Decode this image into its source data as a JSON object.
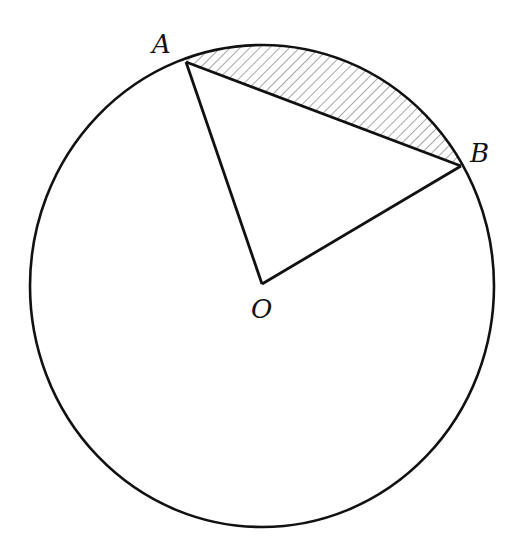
{
  "diagram": {
    "circle": {
      "cx": 262,
      "cy": 286,
      "rx": 232,
      "ry": 241
    },
    "points": {
      "A": {
        "label": "A",
        "x": 186,
        "y": 62
      },
      "B": {
        "label": "B",
        "x": 461,
        "y": 166
      },
      "O": {
        "label": "O",
        "x": 262,
        "y": 284
      }
    },
    "segments": [
      "OA",
      "OB",
      "AB"
    ],
    "shaded_region": "minor segment between chord AB and arc AB (hatched)",
    "colors": {
      "stroke": "#111111",
      "hatch": "#777777",
      "background": "#ffffff"
    }
  }
}
